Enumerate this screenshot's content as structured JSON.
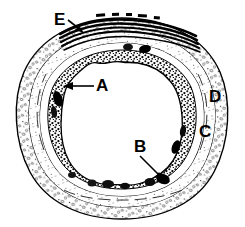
{
  "figure": {
    "background_color": "#ffffff",
    "ink_color": "#000000",
    "width": 245,
    "height": 227
  },
  "labels": [
    {
      "id": "label-a",
      "text": "A",
      "x": 96,
      "y": 91,
      "leader": "horizontal arrow pointing left",
      "target": "inner granular epithelial layer"
    },
    {
      "id": "label-b",
      "text": "B",
      "x": 134,
      "y": 152,
      "leader": "diagonal arrow pointing down-right",
      "target": "lower inner layer / glandular region"
    },
    {
      "id": "label-c",
      "text": "C",
      "x": 199,
      "y": 137,
      "leader": "none",
      "target": "middle connective tissue band"
    },
    {
      "id": "label-d",
      "text": "D",
      "x": 209,
      "y": 102,
      "leader": "none",
      "target": "outer stippled adventitia layer"
    },
    {
      "id": "label-e",
      "text": "E",
      "x": 54,
      "y": 25,
      "leader": "short arrow pointing down-right",
      "target": "stacked wavy laminae at top of section"
    }
  ],
  "structures": {
    "lumen": "central white open space",
    "inner_layer": "dark granular wavy epithelium bordering lumen",
    "middle_layer": "thin pale band with fine striations",
    "outer_layer": "broad stippled band with scattered small oval nuclei",
    "top_laminae": "four to five parallel wavy black lines overlying the top of the section with short dash marks above"
  }
}
